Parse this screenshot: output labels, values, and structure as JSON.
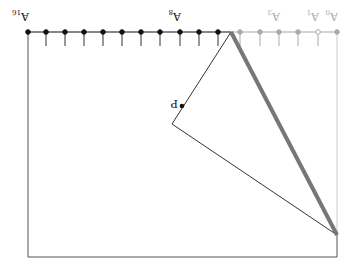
{
  "diagram": {
    "orientation": "rotated 180 degrees",
    "colors": {
      "black": "#111111",
      "active_stroke": "#333333",
      "faded": "#aaaaaa",
      "thick_line": "#777777",
      "frame": "#555555"
    },
    "points": [
      {
        "label": "A",
        "sub": "16",
        "x": 28,
        "state": "active",
        "fill": "solid"
      },
      {
        "label": "",
        "sub": "",
        "x": 46,
        "state": "active",
        "fill": "solid"
      },
      {
        "label": "",
        "sub": "",
        "x": 65,
        "state": "active",
        "fill": "solid"
      },
      {
        "label": "",
        "sub": "",
        "x": 84,
        "state": "active",
        "fill": "solid"
      },
      {
        "label": "",
        "sub": "",
        "x": 103,
        "state": "active",
        "fill": "solid"
      },
      {
        "label": "",
        "sub": "",
        "x": 122,
        "state": "active",
        "fill": "solid"
      },
      {
        "label": "",
        "sub": "",
        "x": 141,
        "state": "active",
        "fill": "solid"
      },
      {
        "label": "",
        "sub": "",
        "x": 160,
        "state": "active",
        "fill": "solid"
      },
      {
        "label": "A",
        "sub": "8",
        "x": 180,
        "state": "active",
        "fill": "solid"
      },
      {
        "label": "",
        "sub": "",
        "x": 199,
        "state": "active",
        "fill": "solid"
      },
      {
        "label": "",
        "sub": "",
        "x": 218,
        "state": "active",
        "fill": "solid"
      },
      {
        "label": "",
        "sub": "",
        "x": 240,
        "state": "faded",
        "fill": "solid"
      },
      {
        "label": "",
        "sub": "",
        "x": 260,
        "state": "faded",
        "fill": "solid"
      },
      {
        "label": "A",
        "sub": "3",
        "x": 279,
        "state": "faded",
        "fill": "solid"
      },
      {
        "label": "",
        "sub": "",
        "x": 298,
        "state": "faded",
        "fill": "solid"
      },
      {
        "label": "A",
        "sub": "1",
        "x": 318,
        "state": "faded",
        "fill": "hollow"
      },
      {
        "label": "A",
        "sub": "0",
        "x": 337,
        "state": "faded",
        "fill": "solid"
      }
    ],
    "point_P": {
      "label": "P",
      "x": 182,
      "y": 106
    },
    "apex": {
      "x": 231,
      "y": 32
    },
    "vertex": {
      "x": 172,
      "y": 124
    },
    "right_corner": {
      "x": 337,
      "y": 235
    },
    "frame": {
      "left": 28,
      "top": 32,
      "right": 337,
      "bottom": 257
    }
  }
}
